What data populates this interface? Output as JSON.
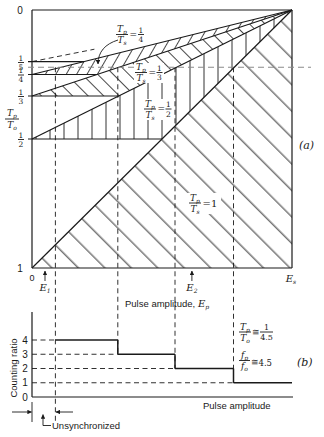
{
  "panel_a": {
    "label": "(a)",
    "top_tick": "0",
    "bottom_tick": "1",
    "origin_tick": "0",
    "y_title": {
      "num_var": "T",
      "num_sub": "p",
      "den_var": "T",
      "den_sub": "o"
    },
    "y_fraction_ticks": [
      {
        "num": "1",
        "den": "5"
      },
      {
        "num": "1",
        "den": "4"
      },
      {
        "num": "1",
        "den": "3"
      },
      {
        "num": "1",
        "den": "2"
      }
    ],
    "x_end_label": {
      "var": "E",
      "sub": "s"
    },
    "x_title": {
      "text": "Pulse amplitude, ",
      "var": "E",
      "sub": "p"
    },
    "markers": [
      {
        "var": "E",
        "sub": "1"
      },
      {
        "var": "E",
        "sub": "2"
      }
    ],
    "curve_labels": [
      {
        "num_var": "T",
        "num_sub": "p",
        "den_var": "T",
        "den_sub": "s",
        "eq": "=",
        "val_num": "1",
        "val_den": "4"
      },
      {
        "num_var": "T",
        "num_sub": "p",
        "den_var": "T",
        "den_sub": "s",
        "eq": "=",
        "val_num": "1",
        "val_den": "3"
      },
      {
        "num_var": "T",
        "num_sub": "p",
        "den_var": "T",
        "den_sub": "s",
        "eq": "=",
        "val_num": "1",
        "val_den": "2"
      },
      {
        "num_var": "T",
        "num_sub": "p",
        "den_var": "T",
        "den_sub": "s",
        "eq": "=1"
      }
    ]
  },
  "panel_b": {
    "label": "(b)",
    "y_title": "Counting ratio",
    "y_ticks": [
      "4",
      "3",
      "2",
      "1",
      "0"
    ],
    "x_title": "Pulse amplitude",
    "annotation_period": {
      "num_var": "T",
      "num_sub": "p",
      "den_var": "T",
      "den_sub": "o",
      "rel": "≅",
      "val_num": "1",
      "val_den": "4.5"
    },
    "annotation_freq": {
      "num_var": "f",
      "num_sub": "p",
      "den_var": "f",
      "den_sub": "o",
      "rel": "≅",
      "value": "4.5"
    },
    "unsync_label": "Unsynchronized"
  },
  "chart_data": [
    {
      "panel": "(a)",
      "type": "line",
      "title": "",
      "xlabel": "Pulse amplitude, E_p",
      "ylabel": "T_p/T_o",
      "x_range": [
        0,
        1
      ],
      "x_tick_labels": [
        "0",
        "E_s"
      ],
      "y_range": [
        0,
        1
      ],
      "y_inverted": true,
      "y_tick_labels": [
        "0",
        "1/5",
        "1/4",
        "1/3",
        "1/2",
        "1"
      ],
      "series": [
        {
          "name": "T_p/T_s = 1",
          "ratio": 1,
          "x": [
            0,
            1
          ],
          "y": [
            1,
            0
          ],
          "style": "solid"
        },
        {
          "name": "T_p/T_s = 1/2",
          "ratio": 0.5,
          "x": [
            0,
            1
          ],
          "y": [
            0.5,
            0
          ],
          "style": "solid"
        },
        {
          "name": "T_p/T_s = 1/3",
          "ratio": 0.3333,
          "x": [
            0,
            1
          ],
          "y": [
            0.3333,
            0
          ],
          "style": "solid"
        },
        {
          "name": "T_p/T_s = 1/4",
          "ratio": 0.25,
          "x": [
            0,
            1
          ],
          "y": [
            0.25,
            0
          ],
          "style": "solid"
        },
        {
          "name": "T_p/T_s = 1/5",
          "ratio": 0.2,
          "x": [
            0,
            0.24
          ],
          "y": [
            0.2,
            0.152
          ],
          "style": "dashed"
        }
      ],
      "steps": [
        {
          "level": 0.5,
          "x_end": 0.5
        },
        {
          "level": 0.3333,
          "x_end": 0.3333
        },
        {
          "level": 0.25,
          "x_end": 0.25
        },
        {
          "level": 0.2,
          "x_end": 0.2
        }
      ],
      "hatched_regions": [
        {
          "between": [
            "T_p/T_s = 1",
            "x-axis"
          ],
          "top_ratio": 1,
          "bottom_ratio": null,
          "floor": 1,
          "hatch": "diagonal-down"
        },
        {
          "between": [
            "T_p/T_s = 1/2",
            "T_p/T_s = 1"
          ],
          "top_ratio": 0.5,
          "bottom_ratio": 1,
          "floor": 0.5,
          "hatch": "vertical"
        },
        {
          "between": [
            "T_p/T_s = 1/3",
            "T_p/T_s = 1/2"
          ],
          "top_ratio": 0.3333,
          "bottom_ratio": 0.5,
          "floor": 0.3333,
          "hatch": "diagonal-down-fine"
        },
        {
          "between": [
            "T_p/T_s = 1/4",
            "T_p/T_s = 1/3"
          ],
          "top_ratio": 0.25,
          "bottom_ratio": 0.3333,
          "floor": 0.25,
          "hatch": "diagonal-up"
        }
      ],
      "reference_line": {
        "y": 0.222,
        "label": "T_p/T_o ≅ 1/4.5",
        "style": "dashed"
      },
      "markers": [
        {
          "label": "E_1",
          "x": 0.05
        },
        {
          "label": "E_2",
          "x": 0.615
        }
      ],
      "sync_boundaries_x": [
        0.09,
        0.33,
        0.55,
        0.775
      ]
    },
    {
      "panel": "(b)",
      "type": "line",
      "step": true,
      "title": "",
      "xlabel": "Pulse amplitude",
      "ylabel": "Counting ratio",
      "x_range": [
        0,
        1
      ],
      "ylim": [
        0,
        4
      ],
      "y_ticks": [
        0,
        1,
        2,
        3,
        4
      ],
      "unsynchronized_range": [
        0,
        0.09
      ],
      "segments": [
        {
          "x_start": 0.09,
          "x_end": 0.33,
          "value": 4
        },
        {
          "x_start": 0.33,
          "x_end": 0.55,
          "value": 3
        },
        {
          "x_start": 0.55,
          "x_end": 0.775,
          "value": 2
        },
        {
          "x_start": 0.775,
          "x_end": 1.0,
          "value": 1
        }
      ],
      "annotations": [
        "T_p/T_o ≅ 1/4.5",
        "f_p/f_o ≅ 4.5",
        "Unsynchronized"
      ]
    }
  ]
}
